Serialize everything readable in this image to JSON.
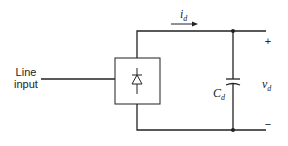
{
  "diagram": {
    "title": "",
    "input_label_line1": "Line",
    "input_label_line2": "input",
    "current_label": {
      "symbol": "i",
      "subscript": "d"
    },
    "capacitor_label": {
      "symbol": "C",
      "subscript": "d"
    },
    "voltage_label": {
      "symbol": "v",
      "subscript": "d"
    },
    "plus_sign": "+",
    "minus_sign": "−",
    "components": [
      {
        "id": "line-input",
        "type": "source-terminal",
        "label": "Line input"
      },
      {
        "id": "rectifier",
        "type": "diode-rectifier-block"
      },
      {
        "id": "dc-capacitor",
        "type": "capacitor",
        "label": "Cd"
      }
    ],
    "line_color": "#222222"
  }
}
